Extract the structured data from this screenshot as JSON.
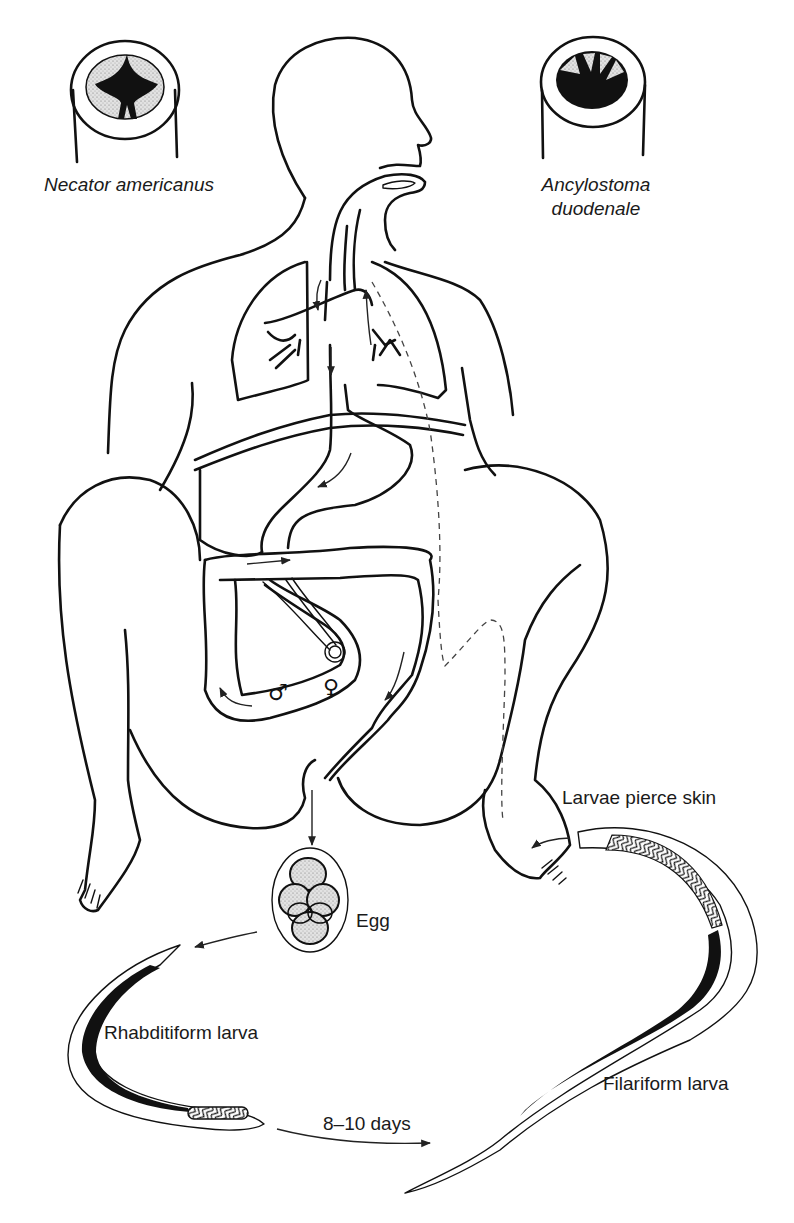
{
  "diagram": {
    "labels": {
      "necator": "Necator americanus",
      "ancylostoma_line1": "Ancylostoma",
      "ancylostoma_line2": "duodenale",
      "egg": "Egg",
      "rhabditiform": "Rhabditiform larva",
      "days": "8–10 days",
      "filariform": "Filariform larva",
      "pierce": "Larvae pierce skin"
    },
    "symbols": {
      "male": "♂",
      "female": "♀"
    },
    "stages": [
      {
        "name": "Adult worms in small intestine",
        "symbols": [
          "male",
          "female"
        ]
      },
      {
        "name": "Egg",
        "passed_in": "feces"
      },
      {
        "name": "Rhabditiform larva"
      },
      {
        "name": "Filariform larva",
        "after": "8–10 days"
      },
      {
        "name": "Larvae pierce skin"
      },
      {
        "name": "Migration via blood to lungs, up trachea, swallowed to intestine"
      }
    ],
    "colors": {
      "ink": "#111111",
      "background": "#ffffff",
      "stipple": "#9a9a9a"
    }
  }
}
